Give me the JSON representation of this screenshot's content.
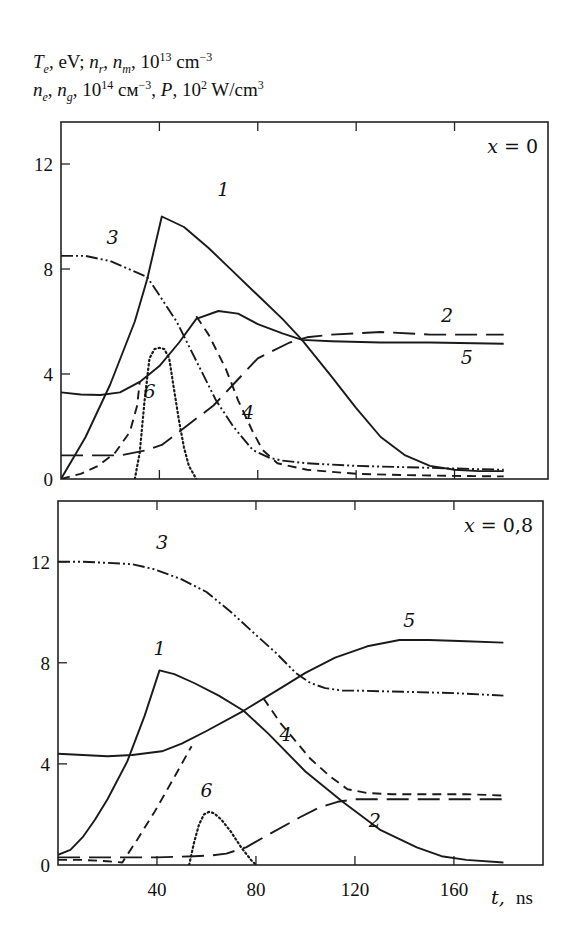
{
  "figure": {
    "ylabel_line1": [
      {
        "t": "T",
        "i": true
      },
      {
        "t": "e",
        "sub": true
      },
      {
        "t": ", eV; "
      },
      {
        "t": "n",
        "i": true
      },
      {
        "t": "r",
        "sub": true
      },
      {
        "t": ", "
      },
      {
        "t": "n",
        "i": true
      },
      {
        "t": "m",
        "sub": true
      },
      {
        "t": ",  10"
      },
      {
        "t": "13",
        "sup": true
      },
      {
        "t": " cm"
      },
      {
        "t": "−3",
        "sup": true
      }
    ],
    "ylabel_line2": [
      {
        "t": "n",
        "i": true
      },
      {
        "t": "e",
        "sub": true
      },
      {
        "t": ", "
      },
      {
        "t": "n",
        "i": true
      },
      {
        "t": "g",
        "sub": true
      },
      {
        "t": ",  10"
      },
      {
        "t": "14",
        "sup": true
      },
      {
        "t": " см"
      },
      {
        "t": "−3",
        "sup": true
      },
      {
        "t": ",  "
      },
      {
        "t": "P",
        "i": true
      },
      {
        "t": ",  10"
      },
      {
        "t": "2",
        "sup": true
      },
      {
        "t": " W/cm"
      },
      {
        "t": "3",
        "sup": true
      }
    ],
    "xlabel_var": "t,",
    "xlabel_unit": "ns"
  },
  "chart_data": [
    {
      "type": "line",
      "title": "x = 0",
      "xlabel": "t, ns",
      "ylabel": "Te, eV; nr, nm, 10^13 cm^-3; ne, ng, 10^14 cm^-3, P, 10^2 W/cm^3",
      "xlim": [
        0,
        198
      ],
      "ylim": [
        0,
        13.6
      ],
      "xticks": [
        0,
        40,
        80,
        120,
        160
      ],
      "xtick_labels": [],
      "yticks": [
        0,
        4,
        8,
        12
      ],
      "ytick_labels": [
        "0",
        "4",
        "8",
        "12"
      ],
      "grid": false,
      "frame": {
        "left": 61,
        "top": 122,
        "right": 548,
        "bottom": 479
      },
      "series": [
        {
          "name": "1",
          "style": "solid",
          "x": [
            0,
            10,
            20,
            30,
            35,
            41,
            50,
            60,
            70,
            80,
            90,
            98,
            110,
            120,
            130,
            140,
            150,
            160,
            170,
            180
          ],
          "y": [
            0,
            1.6,
            3.6,
            6.0,
            7.6,
            10.0,
            9.6,
            8.8,
            7.9,
            7.0,
            6.1,
            5.3,
            3.9,
            2.7,
            1.6,
            0.9,
            0.5,
            0.35,
            0.3,
            0.3
          ],
          "label_pos": [
            66,
            10.8
          ]
        },
        {
          "name": "2",
          "style": "longdash",
          "x": [
            0,
            13,
            24,
            35,
            41,
            48,
            55,
            62,
            70,
            80,
            93,
            100,
            110,
            130,
            150,
            180
          ],
          "y": [
            0.9,
            0.9,
            0.9,
            1.1,
            1.3,
            1.8,
            2.3,
            2.8,
            3.6,
            4.6,
            5.2,
            5.4,
            5.5,
            5.6,
            5.5,
            5.5
          ],
          "label_pos": [
            157,
            6.0
          ]
        },
        {
          "name": "3",
          "style": "dashdotdot",
          "x": [
            0,
            10,
            20,
            30,
            35,
            40,
            47,
            55,
            63,
            70,
            78,
            85,
            90,
            100,
            120,
            140,
            160,
            180
          ],
          "y": [
            8.5,
            8.5,
            8.3,
            7.9,
            7.7,
            7.0,
            6.0,
            4.5,
            3.0,
            2.0,
            1.1,
            0.8,
            0.7,
            0.6,
            0.5,
            0.45,
            0.4,
            0.35
          ],
          "label_pos": [
            21,
            8.95
          ]
        },
        {
          "name": "4",
          "style": "dash",
          "x": [
            0,
            8,
            15,
            22,
            28,
            31,
            32,
            null,
            55,
            60,
            67,
            72,
            78,
            82,
            88,
            100,
            120,
            140,
            160,
            180
          ],
          "y": [
            0,
            0.2,
            0.5,
            1.0,
            1.8,
            2.8,
            3.7,
            null,
            6.2,
            5.5,
            4.2,
            3.0,
            1.8,
            1.1,
            0.6,
            0.35,
            0.2,
            0.15,
            0.12,
            0.1
          ],
          "label_pos": [
            76,
            2.3
          ]
        },
        {
          "name": "5",
          "style": "solid",
          "x": [
            0,
            8,
            16,
            24,
            32,
            40,
            48,
            55,
            64,
            72,
            80,
            90,
            98,
            110,
            130,
            150,
            180
          ],
          "y": [
            3.3,
            3.22,
            3.2,
            3.3,
            3.7,
            4.3,
            5.2,
            6.1,
            6.4,
            6.3,
            5.9,
            5.55,
            5.3,
            5.25,
            5.2,
            5.2,
            5.15
          ],
          "label_pos": [
            165,
            4.4
          ]
        },
        {
          "name": "6",
          "style": "dot",
          "x": [
            30,
            32,
            34,
            36,
            38,
            40,
            42,
            44,
            46,
            48,
            50,
            52,
            55
          ],
          "y": [
            0,
            1.0,
            3.0,
            4.6,
            4.95,
            5.0,
            4.95,
            4.6,
            3.4,
            2.2,
            1.2,
            0.5,
            0
          ],
          "label_pos": [
            36,
            3.1
          ]
        }
      ]
    },
    {
      "type": "line",
      "title": "x = 0,8",
      "xlabel": "t, ns",
      "xlim": [
        0,
        196
      ],
      "ylim": [
        0,
        14.4
      ],
      "xticks": [
        0,
        40,
        80,
        120,
        160
      ],
      "xtick_labels": [
        "40",
        "80",
        "120",
        "160"
      ],
      "yticks": [
        0,
        4,
        8,
        12
      ],
      "ytick_labels": [
        "0",
        "4",
        "8",
        "12"
      ],
      "grid": false,
      "frame": {
        "left": 58,
        "top": 501,
        "right": 543,
        "bottom": 865
      },
      "series": [
        {
          "name": "1",
          "style": "solid",
          "x": [
            0,
            5,
            10,
            15,
            20,
            28,
            35,
            41,
            47,
            55,
            65,
            75,
            85,
            100,
            115,
            130,
            145,
            155,
            165,
            180
          ],
          "y": [
            0.4,
            0.6,
            1.1,
            1.8,
            2.6,
            4.1,
            5.9,
            7.7,
            7.55,
            7.2,
            6.7,
            6.1,
            5.2,
            3.7,
            2.5,
            1.4,
            0.7,
            0.35,
            0.2,
            0.1
          ],
          "label_pos": [
            41,
            8.3
          ]
        },
        {
          "name": "2",
          "style": "longdash",
          "x": [
            0,
            12,
            25,
            40,
            55,
            62,
            68,
            76,
            85,
            98,
            105,
            113,
            120,
            140,
            160,
            180
          ],
          "y": [
            0.3,
            0.3,
            0.3,
            0.3,
            0.35,
            0.38,
            0.45,
            0.7,
            1.2,
            1.9,
            2.25,
            2.5,
            2.6,
            2.6,
            2.6,
            2.6
          ],
          "label_pos": [
            128,
            1.5
          ]
        },
        {
          "name": "3",
          "style": "dashdotdot",
          "x": [
            0,
            10,
            20,
            30,
            39,
            50,
            60,
            70,
            80,
            88,
            96,
            102,
            108,
            115,
            120,
            140,
            160,
            180
          ],
          "y": [
            12.0,
            12.0,
            11.95,
            11.9,
            11.7,
            11.3,
            10.8,
            10.0,
            9.1,
            8.4,
            7.6,
            7.2,
            7.0,
            6.9,
            6.9,
            6.85,
            6.8,
            6.7
          ],
          "label_pos": [
            42,
            12.5
          ]
        },
        {
          "name": "4",
          "style": "dash",
          "x": [
            0,
            10,
            20,
            26,
            32,
            39,
            46,
            54,
            null,
            83,
            90,
            96,
            102,
            110,
            117,
            125,
            135,
            150,
            165,
            180
          ],
          "y": [
            0.2,
            0.2,
            0.15,
            0.1,
            1.0,
            2.1,
            3.3,
            4.7,
            null,
            6.6,
            5.6,
            4.9,
            4.2,
            3.5,
            3.0,
            2.85,
            2.8,
            2.8,
            2.8,
            2.75
          ],
          "label_pos": [
            92,
            4.9
          ]
        },
        {
          "name": "5",
          "style": "solid",
          "x": [
            0,
            10,
            20,
            30,
            42,
            50,
            60,
            75,
            90,
            100,
            112,
            125,
            138,
            150,
            165,
            180
          ],
          "y": [
            4.4,
            4.35,
            4.3,
            4.35,
            4.5,
            4.8,
            5.3,
            6.1,
            7.0,
            7.6,
            8.2,
            8.65,
            8.9,
            8.9,
            8.85,
            8.8
          ],
          "label_pos": [
            142,
            9.4
          ]
        },
        {
          "name": "6",
          "style": "dot",
          "x": [
            53,
            55,
            57,
            59,
            61,
            63,
            66,
            70,
            74,
            78,
            80
          ],
          "y": [
            0,
            0.9,
            1.6,
            2.0,
            2.1,
            2.05,
            1.8,
            1.3,
            0.7,
            0.2,
            0
          ],
          "label_pos": [
            60,
            2.7
          ]
        }
      ]
    }
  ]
}
